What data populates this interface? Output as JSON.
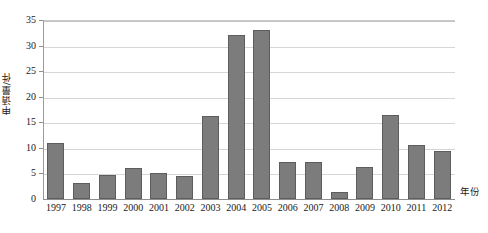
{
  "chart_data": {
    "type": "bar",
    "title": "",
    "xlabel": "年份",
    "ylabel": "申请量/件",
    "categories": [
      "1997",
      "1998",
      "1999",
      "2000",
      "2001",
      "2002",
      "2003",
      "2004",
      "2005",
      "2006",
      "2007",
      "2008",
      "2009",
      "2010",
      "2011",
      "2012"
    ],
    "values": [
      11.0,
      3.2,
      4.6,
      6.0,
      5.0,
      4.5,
      16.3,
      32.0,
      33.0,
      7.3,
      7.3,
      1.3,
      6.3,
      16.5,
      10.5,
      9.4
    ],
    "series": [
      {
        "name": "申请量",
        "values": [
          11.0,
          3.2,
          4.6,
          6.0,
          5.0,
          4.5,
          16.3,
          32.0,
          33.0,
          7.3,
          7.3,
          1.3,
          6.3,
          16.5,
          10.5,
          9.4
        ]
      }
    ],
    "ylim": [
      0,
      35
    ],
    "xlim_categories": 16,
    "y_ticks": [
      0,
      5,
      10,
      15,
      20,
      25,
      30,
      35
    ],
    "y_tick_labels": [
      "0",
      "5",
      "10",
      "15",
      "20",
      "25",
      "30",
      "35"
    ],
    "grid": true,
    "grid_axis": "y",
    "legend": false,
    "legend_position": "none",
    "bar_color": "#7c7c7c",
    "bar_border_color": "#5d5d5d",
    "grid_color": "#d6d6d6",
    "axis_color": "#8e8e8e",
    "background_color": "#ffffff",
    "text_color": "#1a1a1a"
  }
}
